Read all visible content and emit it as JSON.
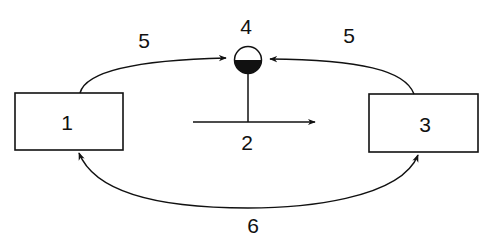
{
  "diagram": {
    "nodes": [
      {
        "id": "1",
        "label": "1"
      },
      {
        "id": "3",
        "label": "3"
      }
    ],
    "labels": {
      "node1": "1",
      "node3": "3",
      "arrow2": "2",
      "gauge4": "4",
      "edge5_left": "5",
      "edge5_right": "5",
      "edge6": "6"
    },
    "colors": {
      "stroke": "#111111",
      "background": "#ffffff"
    }
  }
}
